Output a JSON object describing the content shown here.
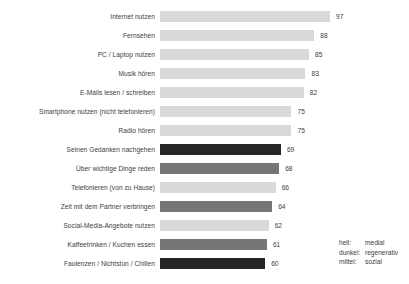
{
  "chart_data": {
    "type": "bar",
    "orientation": "horizontal",
    "title": "",
    "subtitle": "",
    "xlabel": "",
    "ylabel": "",
    "grid": false,
    "xlim": [
      0,
      100
    ],
    "categories": [
      "Internet nutzen",
      "Fernsehen",
      "PC / Laptop nutzen",
      "Musik hören",
      "E-Mails lesen / schreiben",
      "Smartphone nutzen (nicht telefonieren)",
      "Radio hören",
      "Seinen Gedanken nachgehen",
      "Über wichtige Dinge reden",
      "Telefonieren (von zu Hause)",
      "Zeit mit dem Partner verbringen",
      "Social-Media-Angebote nutzen",
      "Kaffeetrinken / Kuchen essen",
      "Faulenzen / Nichtstun / Chillen"
    ],
    "values": [
      97,
      88,
      85,
      83,
      82,
      75,
      75,
      69,
      68,
      66,
      64,
      62,
      61,
      60
    ],
    "bar_shades": [
      "hell",
      "hell",
      "hell",
      "hell",
      "hell",
      "hell",
      "hell",
      "dunkel",
      "mittel",
      "hell",
      "mittel",
      "hell",
      "mittel",
      "dunkel"
    ],
    "colors": {
      "hell": "#d9d9d9",
      "mittel": "#767676",
      "dunkel": "#262626"
    },
    "bars": [
      {
        "label": "Internet nutzen",
        "value": 97,
        "shade": "hell"
      },
      {
        "label": "Fernsehen",
        "value": 88,
        "shade": "hell"
      },
      {
        "label": "PC / Laptop nutzen",
        "value": 85,
        "shade": "hell"
      },
      {
        "label": "Musik hören",
        "value": 83,
        "shade": "hell"
      },
      {
        "label": "E-Mails lesen / schreiben",
        "value": 82,
        "shade": "hell"
      },
      {
        "label": "Smartphone nutzen (nicht telefonieren)",
        "value": 75,
        "shade": "hell"
      },
      {
        "label": "Radio hören",
        "value": 75,
        "shade": "hell"
      },
      {
        "label": "Seinen Gedanken nachgehen",
        "value": 69,
        "shade": "dunkel"
      },
      {
        "label": "Über wichtige Dinge reden",
        "value": 68,
        "shade": "mittel"
      },
      {
        "label": "Telefonieren (von zu Hause)",
        "value": 66,
        "shade": "hell"
      },
      {
        "label": "Zeit mit dem Partner verbringen",
        "value": 64,
        "shade": "mittel"
      },
      {
        "label": "Social-Media-Angebote nutzen",
        "value": 62,
        "shade": "hell"
      },
      {
        "label": "Kaffeetrinken / Kuchen essen",
        "value": 61,
        "shade": "mittel"
      },
      {
        "label": "Faulenzen / Nichtstun / Chillen",
        "value": 60,
        "shade": "dunkel"
      }
    ],
    "legend": {
      "position": "bottom-right",
      "entries": [
        {
          "key": "hell:",
          "value": "medial"
        },
        {
          "key": "dunkel:",
          "value": "regenerativ"
        },
        {
          "key": "mittel:",
          "value": "sozial"
        }
      ]
    }
  }
}
